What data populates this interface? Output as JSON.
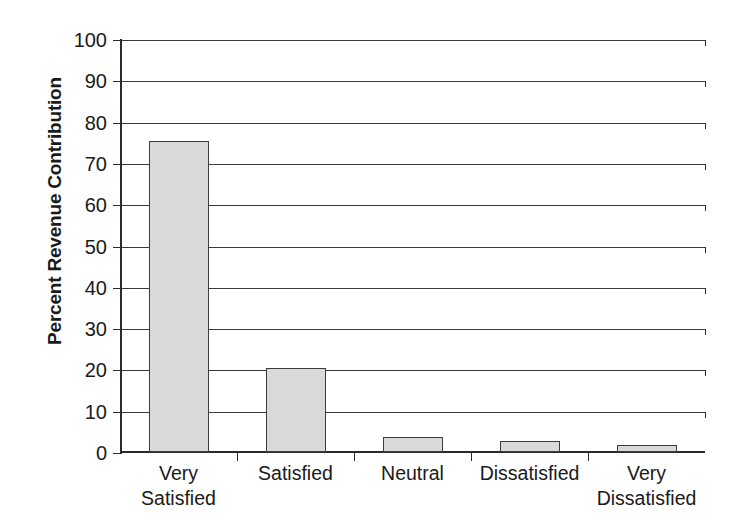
{
  "chart_data": {
    "type": "bar",
    "title": "",
    "subtitle": "",
    "xlabel": "",
    "ylabel": "Percent Revenue Contribution",
    "categories": [
      "Very Satisfied",
      "Satisfied",
      "Neutral",
      "Dissatisfied",
      "Very Dissatisfied"
    ],
    "category_lines": [
      [
        "Very",
        "Satisfied"
      ],
      [
        "Satisfied",
        ""
      ],
      [
        "Neutral",
        ""
      ],
      [
        "Dissatisfied",
        ""
      ],
      [
        "Very",
        "Dissatisfied"
      ]
    ],
    "values": [
      75.2,
      20.3,
      3.6,
      2.7,
      1.8
    ],
    "ylim": [
      0,
      100
    ],
    "ytick_labels": [
      "100",
      "90",
      "80",
      "70",
      "60",
      "50",
      "40",
      "30",
      "20",
      "10",
      "0"
    ],
    "yticks": [
      100,
      90,
      80,
      70,
      60,
      50,
      40,
      30,
      20,
      10,
      0
    ],
    "grid": "horizontal",
    "legend": "none",
    "bar_fill_color": "#d9d9d9",
    "bar_border_color": "#3d3d3d",
    "axis_color": "#2b2b2b",
    "grid_color": "#3a3a3a",
    "background_color": "#ffffff"
  }
}
